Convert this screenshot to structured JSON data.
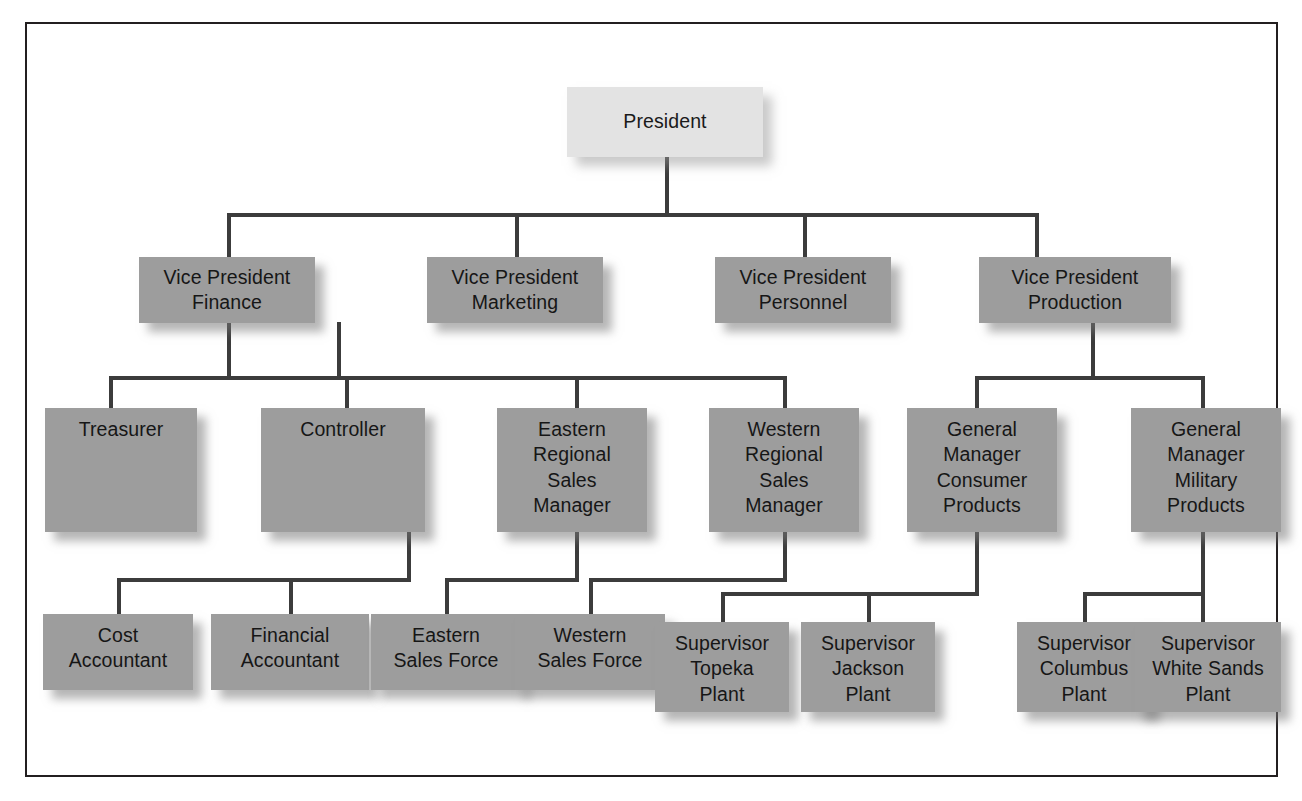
{
  "chart": {
    "type": "org-chart",
    "colors": {
      "root_box": "#e3e3e3",
      "box": "#9d9d9d",
      "connector": "#3c3c3c",
      "frame": "#231f20",
      "background": "#ffffff",
      "text": "#161616"
    },
    "levels": 4,
    "node_count": 17
  },
  "nodes": {
    "president": {
      "label": "President"
    },
    "vp_finance": {
      "label": "Vice President\nFinance"
    },
    "vp_marketing": {
      "label": "Vice President\nMarketing"
    },
    "vp_personnel": {
      "label": "Vice President\nPersonnel"
    },
    "vp_production": {
      "label": "Vice President\nProduction"
    },
    "treasurer": {
      "label": "Treasurer"
    },
    "controller": {
      "label": "Controller"
    },
    "eastern_sales_manager": {
      "label": "Eastern\nRegional\nSales\nManager"
    },
    "western_sales_manager": {
      "label": "Western\nRegional\nSales\nManager"
    },
    "gm_consumer": {
      "label": "General\nManager\nConsumer\nProducts"
    },
    "gm_military": {
      "label": "General\nManager\nMilitary\nProducts"
    },
    "cost_accountant": {
      "label": "Cost\nAccountant"
    },
    "financial_accountant": {
      "label": "Financial\nAccountant"
    },
    "eastern_sales_force": {
      "label": "Eastern\nSales Force"
    },
    "western_sales_force": {
      "label": "Western\nSales Force"
    },
    "supervisor_topeka": {
      "label": "Supervisor\nTopeka\nPlant"
    },
    "supervisor_jackson": {
      "label": "Supervisor\nJackson\nPlant"
    },
    "supervisor_columbus": {
      "label": "Supervisor\nColumbus\nPlant"
    },
    "supervisor_white_sands": {
      "label": "Supervisor\nWhite Sands\nPlant"
    }
  },
  "hierarchy": {
    "root": "President",
    "edges": [
      {
        "from": "President",
        "to": "Vice President Finance"
      },
      {
        "from": "President",
        "to": "Vice President Marketing"
      },
      {
        "from": "President",
        "to": "Vice President Personnel"
      },
      {
        "from": "President",
        "to": "Vice President Production"
      },
      {
        "from": "Vice President Finance",
        "to": "Treasurer"
      },
      {
        "from": "Vice President Finance",
        "to": "Controller"
      },
      {
        "from": "Vice President Marketing",
        "to": "Eastern Regional Sales Manager"
      },
      {
        "from": "Vice President Marketing",
        "to": "Western Regional Sales Manager"
      },
      {
        "from": "Vice President Production",
        "to": "General Manager Consumer Products"
      },
      {
        "from": "Vice President Production",
        "to": "General Manager Military Products"
      },
      {
        "from": "Controller",
        "to": "Cost Accountant"
      },
      {
        "from": "Controller",
        "to": "Financial Accountant"
      },
      {
        "from": "Eastern Regional Sales Manager",
        "to": "Eastern Sales Force"
      },
      {
        "from": "Western Regional Sales Manager",
        "to": "Western Sales Force"
      },
      {
        "from": "General Manager Consumer Products",
        "to": "Supervisor Topeka Plant"
      },
      {
        "from": "General Manager Consumer Products",
        "to": "Supervisor Jackson Plant"
      },
      {
        "from": "General Manager Military Products",
        "to": "Supervisor Columbus Plant"
      },
      {
        "from": "General Manager Military Products",
        "to": "Supervisor White Sands Plant"
      }
    ]
  }
}
